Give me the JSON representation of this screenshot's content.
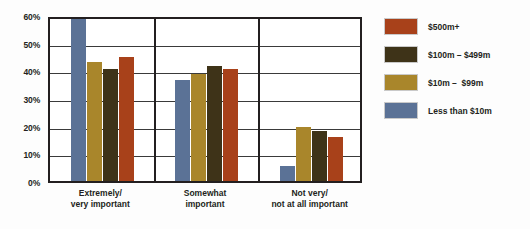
{
  "chart_data": {
    "type": "bar",
    "title": "",
    "xlabel": "",
    "ylabel": "",
    "ylim": [
      0,
      60
    ],
    "ytick_labels": [
      "60%",
      "50%",
      "40%",
      "30%",
      "20%",
      "10%",
      "0%"
    ],
    "ytick_values": [
      60,
      50,
      40,
      30,
      20,
      10,
      0
    ],
    "grid": true,
    "legend_position": "right",
    "categories": [
      "Extremely/\nvery important",
      "Somewhat\nimportant",
      "Not very/\nnot at all important"
    ],
    "category_lines": [
      [
        "Extremely/",
        "very important"
      ],
      [
        "Somewhat",
        "important"
      ],
      [
        "Not very/",
        "not at all important"
      ]
    ],
    "bar_order": [
      "Less than $10m",
      "$10m – $99m",
      "$100m – $499m",
      "$500m+"
    ],
    "series": [
      {
        "name": "Less than $10m",
        "color": "#5b7296",
        "values": [
          58.5,
          36.5,
          5.5
        ]
      },
      {
        "name": "$10m –  $99m",
        "color": "#a9862b",
        "values": [
          43.0,
          38.5,
          19.5
        ]
      },
      {
        "name": "$100m – $499m",
        "color": "#3e3318",
        "values": [
          40.5,
          41.5,
          18.0
        ]
      },
      {
        "name": "$500m+",
        "color": "#a8411a",
        "values": [
          45.0,
          40.5,
          16.0
        ]
      }
    ],
    "legend": [
      {
        "label": "$500m+",
        "color": "#a8411a"
      },
      {
        "label": "$100m – $499m",
        "color": "#3e3318"
      },
      {
        "label": "$10m –  $99m",
        "color": "#a9862b"
      },
      {
        "label": "Less than $10m",
        "color": "#5b7296"
      }
    ]
  }
}
